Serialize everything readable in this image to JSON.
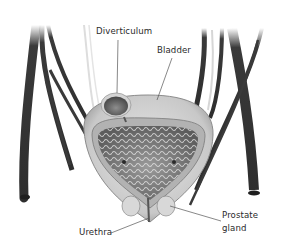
{
  "diagram": {
    "labels": {
      "diverticulum": "Diverticulum",
      "bladder": "Bladder",
      "urethra": "Urethra",
      "prostate_line1": "Prostate",
      "prostate_line2": "gland"
    },
    "colors": {
      "background": "#ffffff",
      "vessel": "#3a3a3a",
      "bladder_wall": "#bdbdbd",
      "bladder_lining": "#8a8a8a",
      "text": "#2a2a2a",
      "leader_line": "#555555"
    }
  }
}
